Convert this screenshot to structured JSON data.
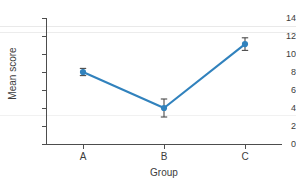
{
  "chart_data": {
    "type": "line",
    "title": "",
    "subtitle": "",
    "xlabel": "Group",
    "ylabel": "Mean score",
    "categories": [
      "A",
      "B",
      "C"
    ],
    "values": [
      8.0,
      4.0,
      11.1
    ],
    "error_low": [
      7.6,
      3.0,
      10.4
    ],
    "error_high": [
      8.4,
      5.0,
      11.8
    ],
    "error_bars": [
      0.4,
      1.0,
      0.7
    ],
    "series": [
      {
        "name": "Mean score",
        "values": [
          8.0,
          4.0,
          11.1
        ],
        "error": [
          0.4,
          1.0,
          0.7
        ],
        "color": "#3182bd",
        "marker": "circle",
        "line": "solid"
      }
    ],
    "xlim": [
      0,
      1
    ],
    "ylim": [
      0,
      14
    ],
    "yticks": [
      0,
      2,
      4,
      6,
      8,
      10,
      12,
      14
    ],
    "ytick_labels": [
      "0",
      "2",
      "4",
      "6",
      "8",
      "10",
      "12",
      "14"
    ],
    "xtick_labels": [
      "A",
      "B",
      "C"
    ],
    "grid": false,
    "legend": false,
    "legend_position": "none",
    "background": "#ffffff",
    "axis_color": "#4d4d4d",
    "text_color": "#3c3c3c",
    "accent_color": "#3182bd"
  },
  "axes": {
    "y_title": "Mean score",
    "x_title": "Group",
    "y_labels": [
      "14",
      "12",
      "10",
      "8",
      "6",
      "4",
      "2",
      "0"
    ],
    "x_labels": [
      "A",
      "B",
      "C"
    ]
  }
}
